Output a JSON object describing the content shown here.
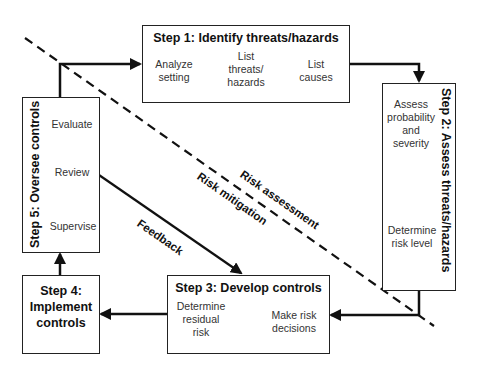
{
  "diagram": {
    "steps": [
      {
        "id": 1,
        "title": "Step 1: Identify threats/hazards",
        "items": [
          "Analyze setting",
          "List threats/ hazards",
          "List causes"
        ],
        "item_lines": [
          [
            "Analyze",
            "setting"
          ],
          [
            "List",
            "threats/",
            "hazards"
          ],
          [
            "List",
            "causes"
          ]
        ]
      },
      {
        "id": 2,
        "title": "Step 2: Assess threats/hazards",
        "items": [
          "Assess probability and severity",
          "Determine risk level"
        ],
        "item_lines": [
          [
            "Assess",
            "probability",
            "and",
            "severity"
          ],
          [
            "Determine",
            "risk level"
          ]
        ]
      },
      {
        "id": 3,
        "title": "Step 3: Develop controls",
        "items": [
          "Make risk decisions",
          "Determine residual risk"
        ],
        "item_lines": [
          [
            "Make risk",
            "decisions"
          ],
          [
            "Determine",
            "residual",
            "risk"
          ]
        ]
      },
      {
        "id": 4,
        "title": "Step 4: Implement controls",
        "title_lines": [
          "Step 4:",
          "Implement",
          "controls"
        ]
      },
      {
        "id": 5,
        "title": "Step 5: Oversee controls",
        "items": [
          "Supervise",
          "Review",
          "Evaluate"
        ]
      }
    ],
    "labels": {
      "risk_assessment": "Risk assessment",
      "risk_mitigation": "Risk mitigation",
      "feedback": "Feedback"
    },
    "colors": {
      "line": "#111111",
      "box_border": "#222222",
      "sub_text": "#333333"
    }
  }
}
